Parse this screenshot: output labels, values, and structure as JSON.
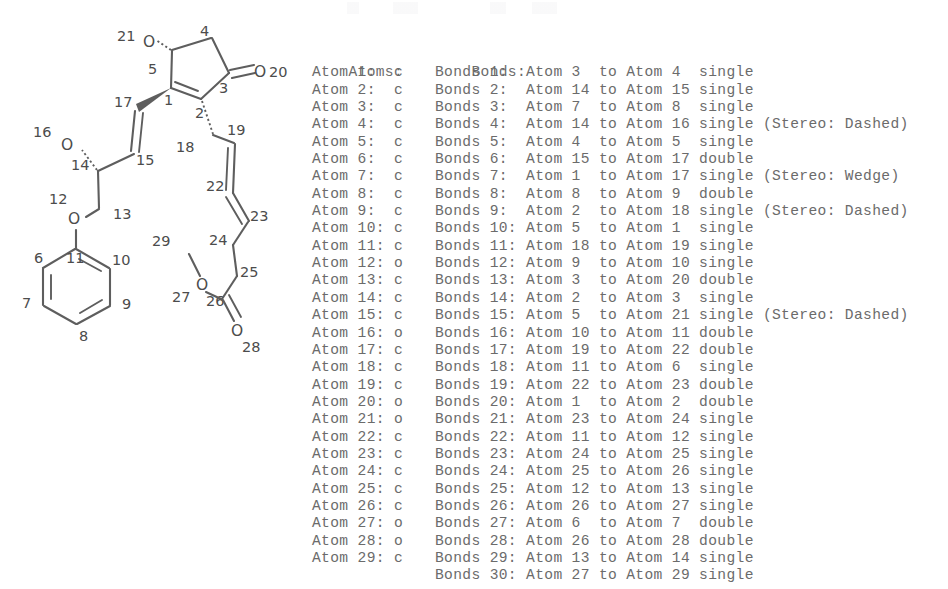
{
  "structure": {
    "title": "molecular-structure-diagram",
    "atom_symbols": [
      {
        "id": "o20",
        "text": "O",
        "x": 242,
        "y": 72
      },
      {
        "id": "o21",
        "text": "O",
        "x": 150,
        "y": 42
      },
      {
        "id": "o16",
        "text": "O",
        "x": 67,
        "y": 143
      },
      {
        "id": "o12",
        "text": "O",
        "x": 74,
        "y": 212
      },
      {
        "id": "o27",
        "text": "O",
        "x": 204,
        "y": 282
      },
      {
        "id": "o28",
        "text": "O",
        "x": 240,
        "y": 318
      }
    ],
    "atom_numbers": [
      {
        "n": "1",
        "x": 169,
        "y": 101
      },
      {
        "n": "2",
        "x": 199,
        "y": 114
      },
      {
        "n": "3",
        "x": 224,
        "y": 88
      },
      {
        "n": "4",
        "x": 205,
        "y": 32
      },
      {
        "n": "5",
        "x": 153,
        "y": 70
      },
      {
        "n": "6",
        "x": 42,
        "y": 257
      },
      {
        "n": "7",
        "x": 28,
        "y": 302
      },
      {
        "n": "8",
        "x": 84,
        "y": 335
      },
      {
        "n": "9",
        "x": 128,
        "y": 303
      },
      {
        "n": "10",
        "x": 119,
        "y": 259
      },
      {
        "n": "11",
        "x": 75,
        "y": 257
      },
      {
        "n": "12",
        "x": 58,
        "y": 198
      },
      {
        "n": "13",
        "x": 121,
        "y": 213
      },
      {
        "n": "14",
        "x": 79,
        "y": 164
      },
      {
        "n": "15",
        "x": 143,
        "y": 159
      },
      {
        "n": "16",
        "x": 42,
        "y": 131
      },
      {
        "n": "17",
        "x": 122,
        "y": 102
      },
      {
        "n": "18",
        "x": 179,
        "y": 146
      },
      {
        "n": "19",
        "x": 233,
        "y": 129
      },
      {
        "n": "20",
        "x": 264,
        "y": 72
      },
      {
        "n": "21",
        "x": 123,
        "y": 39
      },
      {
        "n": "22",
        "x": 215,
        "y": 186
      },
      {
        "n": "23",
        "x": 256,
        "y": 215
      },
      {
        "n": "24",
        "x": 215,
        "y": 239
      },
      {
        "n": "25",
        "x": 248,
        "y": 271
      },
      {
        "n": "26",
        "x": 214,
        "y": 300
      },
      {
        "n": "27",
        "x": 181,
        "y": 296
      },
      {
        "n": "28",
        "x": 250,
        "y": 344
      },
      {
        "n": "29",
        "x": 160,
        "y": 240
      }
    ]
  },
  "table": {
    "atoms_header": "Atoms:",
    "bonds_header": "Bonds:",
    "atoms": [
      {
        "label": "Atom 1:",
        "element": "c"
      },
      {
        "label": "Atom 2:",
        "element": "c"
      },
      {
        "label": "Atom 3:",
        "element": "c"
      },
      {
        "label": "Atom 4:",
        "element": "c"
      },
      {
        "label": "Atom 5:",
        "element": "c"
      },
      {
        "label": "Atom 6:",
        "element": "c"
      },
      {
        "label": "Atom 7:",
        "element": "c"
      },
      {
        "label": "Atom 8:",
        "element": "c"
      },
      {
        "label": "Atom 9:",
        "element": "c"
      },
      {
        "label": "Atom 10:",
        "element": "c"
      },
      {
        "label": "Atom 11:",
        "element": "c"
      },
      {
        "label": "Atom 12:",
        "element": "o"
      },
      {
        "label": "Atom 13:",
        "element": "c"
      },
      {
        "label": "Atom 14:",
        "element": "c"
      },
      {
        "label": "Atom 15:",
        "element": "c"
      },
      {
        "label": "Atom 16:",
        "element": "o"
      },
      {
        "label": "Atom 17:",
        "element": "c"
      },
      {
        "label": "Atom 18:",
        "element": "c"
      },
      {
        "label": "Atom 19:",
        "element": "c"
      },
      {
        "label": "Atom 20:",
        "element": "o"
      },
      {
        "label": "Atom 21:",
        "element": "o"
      },
      {
        "label": "Atom 22:",
        "element": "c"
      },
      {
        "label": "Atom 23:",
        "element": "c"
      },
      {
        "label": "Atom 24:",
        "element": "c"
      },
      {
        "label": "Atom 25:",
        "element": "c"
      },
      {
        "label": "Atom 26:",
        "element": "c"
      },
      {
        "label": "Atom 27:",
        "element": "o"
      },
      {
        "label": "Atom 28:",
        "element": "o"
      },
      {
        "label": "Atom 29:",
        "element": "c"
      }
    ],
    "bonds": [
      {
        "label": "Bonds 1:",
        "from": "3",
        "to": "4",
        "order": "single",
        "stereo": ""
      },
      {
        "label": "Bonds 2:",
        "from": "14",
        "to": "15",
        "order": "single",
        "stereo": ""
      },
      {
        "label": "Bonds 3:",
        "from": "7",
        "to": "8",
        "order": "single",
        "stereo": ""
      },
      {
        "label": "Bonds 4:",
        "from": "14",
        "to": "16",
        "order": "single",
        "stereo": "(Stereo: Dashed)"
      },
      {
        "label": "Bonds 5:",
        "from": "4",
        "to": "5",
        "order": "single",
        "stereo": ""
      },
      {
        "label": "Bonds 6:",
        "from": "15",
        "to": "17",
        "order": "double",
        "stereo": ""
      },
      {
        "label": "Bonds 7:",
        "from": "1",
        "to": "17",
        "order": "single",
        "stereo": "(Stereo: Wedge)"
      },
      {
        "label": "Bonds 8:",
        "from": "8",
        "to": "9",
        "order": "double",
        "stereo": ""
      },
      {
        "label": "Bonds 9:",
        "from": "2",
        "to": "18",
        "order": "single",
        "stereo": "(Stereo: Dashed)"
      },
      {
        "label": "Bonds 10:",
        "from": "5",
        "to": "1",
        "order": "single",
        "stereo": ""
      },
      {
        "label": "Bonds 11:",
        "from": "18",
        "to": "19",
        "order": "single",
        "stereo": ""
      },
      {
        "label": "Bonds 12:",
        "from": "9",
        "to": "10",
        "order": "single",
        "stereo": ""
      },
      {
        "label": "Bonds 13:",
        "from": "3",
        "to": "20",
        "order": "double",
        "stereo": ""
      },
      {
        "label": "Bonds 14:",
        "from": "2",
        "to": "3",
        "order": "single",
        "stereo": ""
      },
      {
        "label": "Bonds 15:",
        "from": "5",
        "to": "21",
        "order": "single",
        "stereo": "(Stereo: Dashed)"
      },
      {
        "label": "Bonds 16:",
        "from": "10",
        "to": "11",
        "order": "double",
        "stereo": ""
      },
      {
        "label": "Bonds 17:",
        "from": "19",
        "to": "22",
        "order": "double",
        "stereo": ""
      },
      {
        "label": "Bonds 18:",
        "from": "11",
        "to": "6",
        "order": "single",
        "stereo": ""
      },
      {
        "label": "Bonds 19:",
        "from": "22",
        "to": "23",
        "order": "double",
        "stereo": ""
      },
      {
        "label": "Bonds 20:",
        "from": "1",
        "to": "2",
        "order": "double",
        "stereo": ""
      },
      {
        "label": "Bonds 21:",
        "from": "23",
        "to": "24",
        "order": "single",
        "stereo": ""
      },
      {
        "label": "Bonds 22:",
        "from": "11",
        "to": "12",
        "order": "single",
        "stereo": ""
      },
      {
        "label": "Bonds 23:",
        "from": "24",
        "to": "25",
        "order": "single",
        "stereo": ""
      },
      {
        "label": "Bonds 24:",
        "from": "25",
        "to": "26",
        "order": "single",
        "stereo": ""
      },
      {
        "label": "Bonds 25:",
        "from": "12",
        "to": "13",
        "order": "single",
        "stereo": ""
      },
      {
        "label": "Bonds 26:",
        "from": "26",
        "to": "27",
        "order": "single",
        "stereo": ""
      },
      {
        "label": "Bonds 27:",
        "from": "6",
        "to": "7",
        "order": "double",
        "stereo": ""
      },
      {
        "label": "Bonds 28:",
        "from": "26",
        "to": "28",
        "order": "double",
        "stereo": ""
      },
      {
        "label": "Bonds 29:",
        "from": "13",
        "to": "14",
        "order": "single",
        "stereo": ""
      },
      {
        "label": "Bonds 30:",
        "from": "27",
        "to": "29",
        "order": "single",
        "stereo": ""
      }
    ]
  },
  "colors": {
    "text": "#6b6b6b",
    "bond": "#5e5e5e",
    "label": "#4c4c4c",
    "background": "#ffffff"
  }
}
